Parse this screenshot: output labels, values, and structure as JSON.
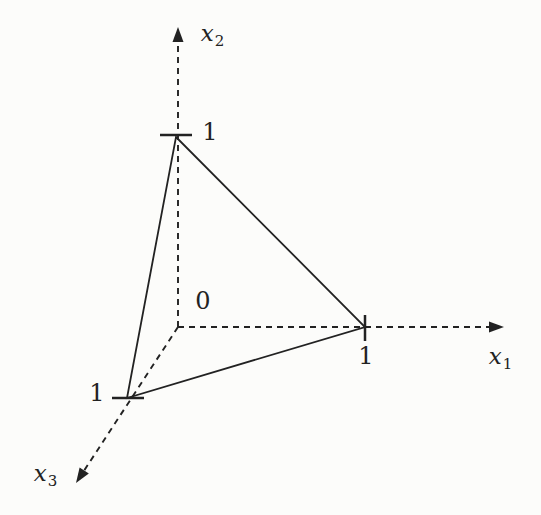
{
  "figure": {
    "ink_color": "#222222",
    "background_color": "#fcfcfa",
    "canvas": {
      "width": 541,
      "height": 515
    },
    "origin": {
      "x": 178,
      "y": 327,
      "label": "0",
      "label_pos": {
        "x": 203,
        "y": 301
      }
    },
    "axes": [
      {
        "id": "x1",
        "base": "x",
        "sub": "1",
        "from": {
          "x": 178,
          "y": 327
        },
        "to": {
          "x": 504,
          "y": 327
        },
        "label_pos": {
          "x": 500,
          "y": 356
        },
        "tick": {
          "x1": 365,
          "y1": 315,
          "x2": 365,
          "y2": 341
        },
        "tick_label": "1",
        "tick_label_pos": {
          "x": 366,
          "y": 356
        }
      },
      {
        "id": "x2",
        "base": "x",
        "sub": "2",
        "from": {
          "x": 178,
          "y": 327
        },
        "to": {
          "x": 178,
          "y": 27
        },
        "label_pos": {
          "x": 212,
          "y": 33
        },
        "tick": {
          "x1": 160,
          "y1": 135,
          "x2": 192,
          "y2": 135
        },
        "tick_label": "1",
        "tick_label_pos": {
          "x": 210,
          "y": 132
        }
      },
      {
        "id": "x3",
        "base": "x",
        "sub": "3",
        "from": {
          "x": 178,
          "y": 327
        },
        "to": {
          "x": 76,
          "y": 483
        },
        "label_pos": {
          "x": 45,
          "y": 473
        },
        "tick": {
          "x1": 112,
          "y1": 398,
          "x2": 144,
          "y2": 398
        },
        "tick_label": "1",
        "tick_label_pos": {
          "x": 97,
          "y": 393
        }
      }
    ],
    "triangle": {
      "vertices": [
        {
          "id": "e2",
          "x": 176,
          "y": 137
        },
        {
          "id": "e1",
          "x": 365,
          "y": 327
        },
        {
          "id": "e3",
          "x": 127,
          "y": 398
        }
      ]
    },
    "style": {
      "dash": "6 5",
      "axis_width": 1.9,
      "edge_width": 1.8,
      "tick_width": 2.5,
      "arrow_length": 15,
      "arrow_half_width": 5.5
    }
  }
}
